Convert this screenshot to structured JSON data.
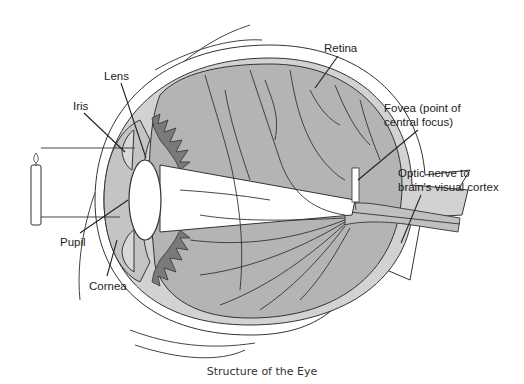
{
  "figure": {
    "caption": "Structure of the Eye",
    "labels": {
      "lens": "Lens",
      "iris": "Iris",
      "pupil": "Pupil",
      "cornea": "Cornea",
      "retina": "Retina",
      "fovea_line1": "Fovea (point of",
      "fovea_line2": "central focus)",
      "optic_line1": "Optic nerve to",
      "optic_line2": "brain's visual cortex"
    },
    "colors": {
      "vitreous": "#b4b4b4",
      "layer_light": "#d2d2d2",
      "ciliary": "#7a7a7a",
      "outline": "#333333",
      "light_path": "#ffffff"
    }
  }
}
